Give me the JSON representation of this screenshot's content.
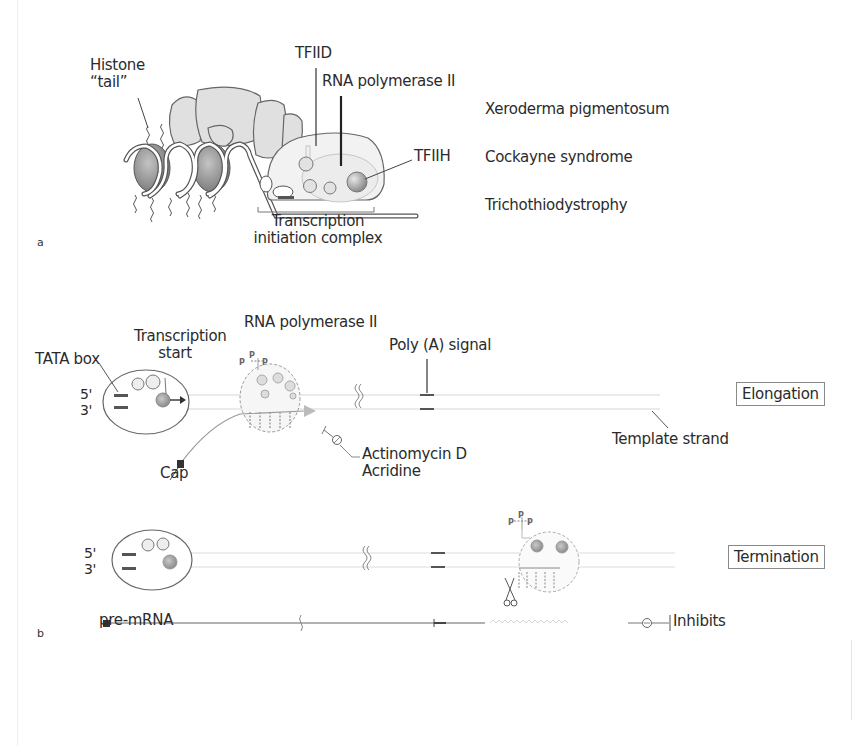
{
  "figure": {
    "panel_a": {
      "letter": "a",
      "labels": {
        "histone_tail_line1": "Histone",
        "histone_tail_line2": "“tail”",
        "tfiid": "TFIID",
        "rna_pol_ii": "RNA polymerase II",
        "tfiih": "TFIIH",
        "complex_line1": "Transcription",
        "complex_line2": "initiation complex"
      },
      "diseases": [
        "Xeroderma pigmentosum",
        "Cockayne syndrome",
        "Trichothiodystrophy"
      ]
    },
    "panel_b": {
      "letter": "b",
      "labels": {
        "tata_box": "TATA box",
        "transcription_start_line1": "Transcription",
        "transcription_start_line2": "start",
        "rna_pol_ii": "RNA polymerase II",
        "poly_a_signal": "Poly (A) signal",
        "five_prime": "5'",
        "three_prime": "3'",
        "cap": "Cap",
        "inhibitor_line1": "Actinomycin D",
        "inhibitor_line2": "Acridine",
        "template_strand": "Template strand",
        "five_prime_b": "5'",
        "three_prime_b": "3'",
        "pre_mrna": "pre-mRNA",
        "phospho": "P",
        "inhibits_legend": "Inhibits"
      },
      "stages": {
        "elongation": "Elongation",
        "termination": "Termination"
      }
    },
    "colors": {
      "outline": "#555555",
      "fill_light": "#e2e2e2",
      "fill_dark": "#8f8f8f",
      "strand": "#c8c8c8",
      "text": "#2b2b2b"
    }
  }
}
